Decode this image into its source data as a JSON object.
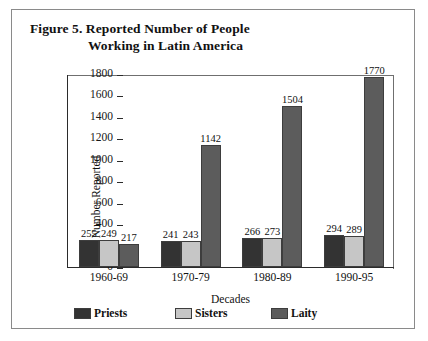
{
  "figure": {
    "title_line_1": "Figure 5.  Reported Number of People",
    "title_line_2": "Working in Latin America"
  },
  "chart_data": {
    "type": "bar",
    "title": "Figure 5. Reported Number of People Working in Latin America",
    "xlabel": "Decades",
    "ylabel": "Number Reported",
    "ylim": [
      0,
      1800
    ],
    "ytick_step": 200,
    "yticks": [
      "1800",
      "1600",
      "1400",
      "1200",
      "1000",
      "800",
      "600",
      "400",
      "200",
      "0"
    ],
    "grid": false,
    "legend_position": "bottom",
    "categories": [
      "1960-69",
      "1970-79",
      "1980-89",
      "1990-95"
    ],
    "series": [
      {
        "name": "Priests",
        "color": "#333333",
        "values": [
          255,
          241,
          266,
          294
        ]
      },
      {
        "name": "Sisters",
        "color": "#c6c6c6",
        "values": [
          249,
          243,
          273,
          289
        ]
      },
      {
        "name": "Laity",
        "color": "#5c5c5c",
        "values": [
          217,
          1142,
          1504,
          1770
        ]
      }
    ],
    "value_labels": [
      [
        "255",
        "249",
        "217"
      ],
      [
        "241",
        "243",
        "1142"
      ],
      [
        "266",
        "273",
        "1504"
      ],
      [
        "294",
        "289",
        "1770"
      ]
    ]
  }
}
